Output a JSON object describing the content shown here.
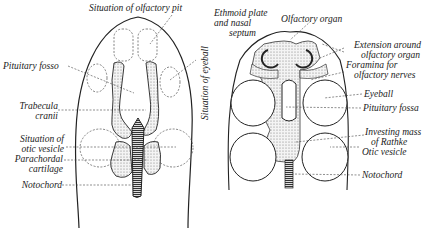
{
  "figure": {
    "left_panel": {
      "labels": {
        "olfactory_pit": "Situation of olfactory pit",
        "pituitary": "Pituitary fosso",
        "trabecula_1": "Trabecula",
        "trabecula_2": "cranii",
        "otic_1": "Situation of",
        "otic_2": "otic vesicle",
        "parachordal_1": "Parachordal",
        "parachordal_2": "cartilage",
        "notochord": "Notochord",
        "eyeball": "Situation of eyeball"
      }
    },
    "right_panel": {
      "labels": {
        "ethmoid_1": "Ethmoid plate",
        "ethmoid_2": "and nasal",
        "ethmoid_3": "septum",
        "olfactory_organ": "Olfactory organ",
        "extension_1": "Extension around",
        "extension_2": "olfactory organ",
        "foramina_1": "Foramina for",
        "foramina_2": "olfactory nerves",
        "eyeball": "Eyeball",
        "pituitary": "Pituitary fossa",
        "investing_1": "Investing mass",
        "investing_2": "of Rathke",
        "otic": "Otic vesicle",
        "notochord": "Notochord"
      }
    }
  }
}
